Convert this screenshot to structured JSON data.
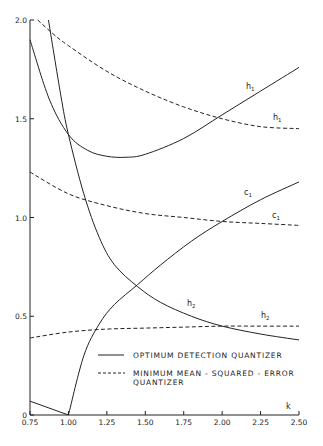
{
  "chart_data": {
    "type": "line",
    "title": "",
    "xlabel": "k",
    "ylabel": "",
    "xlim": [
      0.75,
      2.5
    ],
    "ylim": [
      0,
      2.0
    ],
    "grid": false,
    "x_ticks": [
      "0.75",
      "1.00",
      "1.25",
      "1.50",
      "1.75",
      "2.00",
      "2.25",
      "2.50"
    ],
    "y_ticks": [
      "0",
      "0.5",
      "1.0",
      "1.5",
      "2.0"
    ],
    "legend": {
      "position": "lower right, inside plot",
      "entries": [
        {
          "style": "solid",
          "label": "OPTIMUM DETECTION QUANTIZER"
        },
        {
          "style": "dashed",
          "label_line1": "MINIMUM MEAN - SQUARED - ERROR",
          "label_line2": "QUANTIZER"
        }
      ]
    },
    "series": [
      {
        "name": "h1",
        "style": "solid",
        "label": "h1",
        "x": [
          0.75,
          0.875,
          1.0,
          1.125,
          1.25,
          1.375,
          1.5,
          1.75,
          2.0,
          2.25,
          2.5
        ],
        "y": [
          1.9,
          1.6,
          1.42,
          1.34,
          1.31,
          1.305,
          1.32,
          1.4,
          1.52,
          1.64,
          1.76
        ]
      },
      {
        "name": "h1",
        "style": "dashed",
        "label": "h1",
        "x": [
          0.8,
          0.9,
          1.0,
          1.25,
          1.5,
          1.75,
          2.0,
          2.25,
          2.5
        ],
        "y": [
          2.0,
          1.93,
          1.87,
          1.74,
          1.64,
          1.56,
          1.5,
          1.46,
          1.45
        ],
        "note": "lower dashed h1"
      },
      {
        "name": "h2",
        "style": "solid",
        "label": "h2",
        "x": [
          0.87,
          0.95,
          1.0,
          1.1,
          1.2,
          1.3,
          1.45,
          1.6,
          1.8,
          2.0,
          2.25,
          2.5
        ],
        "y": [
          2.0,
          1.62,
          1.42,
          1.12,
          0.9,
          0.76,
          0.65,
          0.57,
          0.5,
          0.45,
          0.41,
          0.38
        ]
      },
      {
        "name": "h2",
        "style": "dashed",
        "label": "h2",
        "x": [
          0.75,
          1.0,
          1.25,
          1.5,
          1.75,
          2.0,
          2.25,
          2.5
        ],
        "y": [
          0.39,
          0.42,
          0.435,
          0.44,
          0.445,
          0.45,
          0.45,
          0.45
        ]
      },
      {
        "name": "c1",
        "style": "solid",
        "label": "c1",
        "x": [
          0.75,
          1.0,
          1.1,
          1.2,
          1.3,
          1.45,
          1.6,
          1.8,
          2.0,
          2.25,
          2.5
        ],
        "y": [
          0.07,
          0.0,
          0.3,
          0.46,
          0.56,
          0.66,
          0.76,
          0.88,
          0.98,
          1.09,
          1.18
        ]
      },
      {
        "name": "c1",
        "style": "dashed",
        "label": "c1",
        "x": [
          0.75,
          1.0,
          1.25,
          1.5,
          1.75,
          2.0,
          2.25,
          2.5
        ],
        "y": [
          1.23,
          1.12,
          1.06,
          1.02,
          1.0,
          0.98,
          0.97,
          0.96
        ]
      }
    ]
  },
  "axis": {
    "x_label": "k",
    "y_zero": "0"
  },
  "labels": {
    "h1_solid": "h",
    "h1_solid_sub": "1",
    "h1_dashed": "h",
    "h1_dashed_sub": "1",
    "c1_solid": "c",
    "c1_solid_sub": "1",
    "c1_dashed": "c",
    "c1_dashed_sub": "1",
    "h2_solid": "h",
    "h2_solid_sub": "2",
    "h2_dashed": "h",
    "h2_dashed_sub": "2"
  },
  "legend": {
    "solid_label": "OPTIMUM DETECTION QUANTIZER",
    "dashed_label_line1": "MINIMUM MEAN - SQUARED - ERROR",
    "dashed_label_line2": "QUANTIZER"
  }
}
